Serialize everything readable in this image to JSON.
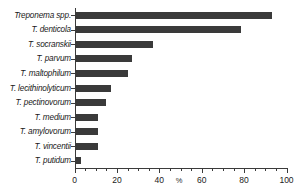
{
  "chart_data": {
    "type": "bar",
    "orientation": "horizontal",
    "title": "",
    "subtitle": "",
    "xlabel": "%",
    "ylabel": "",
    "xlim": [
      0,
      100
    ],
    "grid": false,
    "legend": null,
    "bar_color": "#3a3a3a",
    "axis_color": "#3b3b3b",
    "background_color": "#ffffff",
    "x_major_ticks": [
      0,
      20,
      40,
      60,
      80,
      100
    ],
    "x_minor_tick_interval": 5,
    "x_tick_labels": [
      "0",
      "20",
      "40",
      "60",
      "80",
      "100"
    ],
    "categories": [
      "Treponema spp.",
      "T. denticola",
      "T. socranskii",
      "T. parvum",
      "T. maltophilum",
      "T. lecithinolyticum",
      "T. pectinovorum",
      "T. medium",
      "T. amylovorum",
      "T. vincentii",
      "T. putidum"
    ],
    "values": [
      93,
      78.5,
      37,
      27,
      25,
      17,
      15,
      11,
      11,
      11,
      3
    ]
  }
}
